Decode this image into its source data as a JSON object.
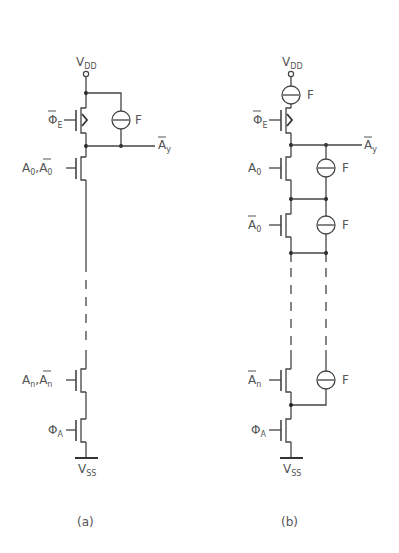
{
  "figure": {
    "panels": [
      {
        "id": "a",
        "caption": "(a)",
        "supply_top": {
          "label": "V",
          "sub": "DD"
        },
        "supply_bottom": {
          "label": "V",
          "sub": "SS"
        },
        "clock_enable": {
          "label": "Φ",
          "sub": "E",
          "overbar": true
        },
        "output": {
          "label": "A",
          "sub": "y",
          "overbar": true
        },
        "fuse_label": "F",
        "transistors": [
          {
            "gate": "A0,Ā0",
            "label_main": "A",
            "label_sub": "0",
            "label_sep": ",",
            "label_main2": "A",
            "label_sub2": "0"
          },
          {
            "gate": "An,Ān",
            "label_main": "A",
            "label_sub": "n",
            "label_sep": ",",
            "label_main2": "A",
            "label_sub2": "n"
          }
        ],
        "clock_ground": {
          "label": "Φ",
          "sub": "A"
        }
      },
      {
        "id": "b",
        "caption": "(b)",
        "supply_top": {
          "label": "V",
          "sub": "DD"
        },
        "supply_bottom": {
          "label": "V",
          "sub": "SS"
        },
        "clock_enable": {
          "label": "Φ",
          "sub": "E",
          "overbar": true
        },
        "output": {
          "label": "A",
          "sub": "y",
          "overbar": true
        },
        "fuse_label": "F",
        "transistors": [
          {
            "gate": "A0",
            "label_main": "A",
            "label_sub": "0",
            "overbar": false
          },
          {
            "gate": "Ā0",
            "label_main": "A",
            "label_sub": "0",
            "overbar": true
          },
          {
            "gate": "Ān",
            "label_main": "A",
            "label_sub": "n",
            "overbar": true
          }
        ],
        "clock_ground": {
          "label": "Φ",
          "sub": "A"
        }
      }
    ]
  }
}
